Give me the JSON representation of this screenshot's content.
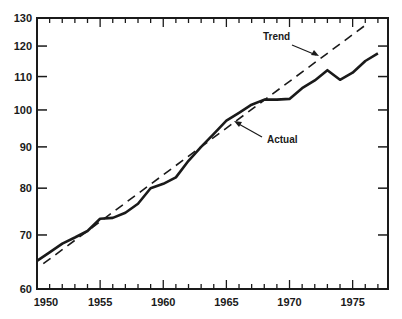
{
  "chart_data": {
    "type": "line",
    "title": "",
    "xlabel": "",
    "ylabel": "",
    "yscale": "log",
    "xlim": [
      1950,
      1977.8
    ],
    "ylim": [
      60,
      130
    ],
    "grid": false,
    "xticks": [
      1950,
      1955,
      1960,
      1965,
      1970,
      1975
    ],
    "xtick_labels": [
      "1950",
      "1955",
      "1960",
      "1965",
      "1970",
      "1975"
    ],
    "yticks": [
      60,
      70,
      80,
      90,
      100,
      110,
      120,
      130
    ],
    "ytick_labels": [
      "60",
      "70",
      "80",
      "90",
      "100",
      "110",
      "120",
      "130"
    ],
    "series": [
      {
        "name": "Actual",
        "style": "solid",
        "x": [
          1950,
          1951,
          1952,
          1953,
          1954,
          1955,
          1956,
          1957,
          1958,
          1959,
          1960,
          1961,
          1962,
          1963,
          1964,
          1965,
          1966,
          1967,
          1968,
          1969,
          1970,
          1971,
          1972,
          1973,
          1974,
          1975,
          1976,
          1977
        ],
        "values": [
          65.0,
          66.6,
          68.3,
          69.5,
          70.8,
          73.3,
          73.5,
          74.6,
          76.5,
          80.0,
          81.0,
          82.5,
          86.5,
          90.0,
          93.4,
          97.0,
          99.2,
          101.5,
          103.0,
          103.0,
          103.2,
          106.4,
          108.8,
          112.0,
          109.0,
          111.2,
          115.0,
          117.5
        ]
      },
      {
        "name": "Trend",
        "style": "dashed",
        "x": [
          1950.5,
          1976.2
        ],
        "values": [
          64.5,
          128.0
        ]
      }
    ],
    "annotations": [
      {
        "text": "Trend",
        "points_to_series": "Trend"
      },
      {
        "text": "Actual",
        "points_to_series": "Actual"
      }
    ]
  }
}
